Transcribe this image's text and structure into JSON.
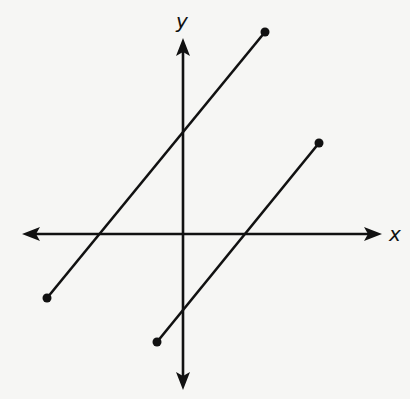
{
  "diagram": {
    "type": "coordinate-plane",
    "axes": {
      "x_label": "x",
      "y_label": "y",
      "origin_px": [
        183,
        234
      ],
      "x_axis_px": [
        22,
        382
      ],
      "y_axis_px": [
        38,
        390
      ]
    },
    "segments": [
      {
        "name": "segment-upper-left",
        "start_px": [
          47,
          298
        ],
        "end_px": [
          265,
          32
        ],
        "endpoints": "closed-dots"
      },
      {
        "name": "segment-lower-right",
        "start_px": [
          157,
          342
        ],
        "end_px": [
          319,
          143
        ],
        "endpoints": "closed-dots"
      }
    ],
    "relationship": "parallel lines",
    "color": "#111111"
  }
}
